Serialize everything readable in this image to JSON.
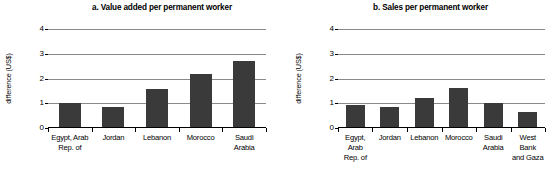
{
  "figure": {
    "ylabel": "difference (US$)",
    "bar_color": "#3a3a3a",
    "gridline_color": "#8a8a8a"
  },
  "chart_data": [
    {
      "type": "bar",
      "panel": "a",
      "title": "a. Value added per permanent worker",
      "xlabel": "",
      "ylabel": "difference (US$)",
      "ylim": [
        0,
        4
      ],
      "yticks": [
        0,
        1,
        2,
        3,
        4
      ],
      "ytick_labels": [
        "0",
        "1",
        "2",
        "3",
        "4"
      ],
      "grid": true,
      "legend": "none",
      "categories": [
        "Egypt, Arab Rep. of",
        "Jordan",
        "Lebanon",
        "Morocco",
        "Saudi Arabia"
      ],
      "category_lines": [
        [
          "Egypt, Arab",
          "Rep. of"
        ],
        [
          "Jordan",
          ""
        ],
        [
          "Lebanon",
          ""
        ],
        [
          "Morocco",
          ""
        ],
        [
          "Saudi",
          "Arabia"
        ]
      ],
      "values": [
        1.0,
        0.8,
        1.55,
        2.15,
        2.7
      ]
    },
    {
      "type": "bar",
      "panel": "b",
      "title": "b. Sales per permanent worker",
      "xlabel": "",
      "ylabel": "difference (US$)",
      "ylim": [
        0,
        4
      ],
      "yticks": [
        0,
        1,
        2,
        3,
        4
      ],
      "ytick_labels": [
        "0",
        "1",
        "2",
        "3",
        "4"
      ],
      "grid": true,
      "legend": "none",
      "categories": [
        "Egypt, Arab Rep. of",
        "Jordan",
        "Lebanon",
        "Morocco",
        "Saudi Arabia",
        "West Bank and Gaza"
      ],
      "category_lines": [
        [
          "Egypt, Arab",
          "Rep. of"
        ],
        [
          "Jordan",
          ""
        ],
        [
          "Lebanon",
          ""
        ],
        [
          "Morocco",
          ""
        ],
        [
          "Saudi",
          "Arabia"
        ],
        [
          "West Bank",
          "and Gaza"
        ]
      ],
      "values": [
        0.9,
        0.82,
        1.2,
        1.6,
        1.0,
        0.6
      ]
    }
  ]
}
